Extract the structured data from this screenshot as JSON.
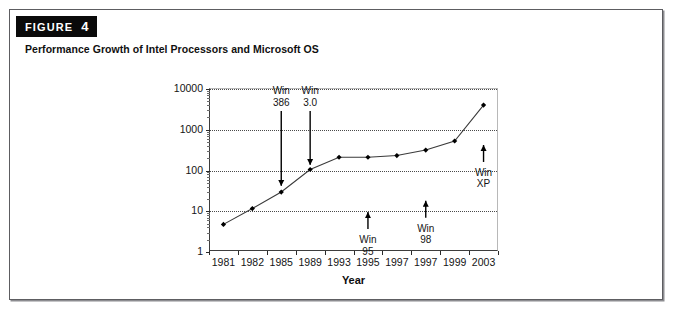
{
  "figure": {
    "badge_word": "FIGURE",
    "badge_number": "4",
    "caption": "Performance Growth of Intel Processors and Microsoft OS"
  },
  "chart_data": {
    "type": "line",
    "title": "Performance Growth of Intel Processors and Microsoft OS",
    "xlabel": "Year",
    "ylabel": "",
    "yscale": "log",
    "ylim": [
      1,
      10000
    ],
    "grid": true,
    "legend": "none",
    "categories": [
      "1981",
      "1982",
      "1985",
      "1989",
      "1993",
      "1995",
      "1997",
      "1997",
      "1999",
      "2003"
    ],
    "y_ticks": [
      "1",
      "10",
      "100",
      "1000",
      "10000"
    ],
    "series": [
      {
        "name": "Intel processor performance",
        "values": [
          4.5,
          11,
          28,
          100,
          200,
          200,
          220,
          300,
          500,
          3800
        ]
      }
    ],
    "annotations": [
      {
        "label_line1": "Win",
        "label_line2": "386",
        "year": "1985",
        "direction": "down",
        "value": 40
      },
      {
        "label_line1": "Win",
        "label_line2": "3.0",
        "year": "1989",
        "direction": "down",
        "value": 130
      },
      {
        "label_line1": "Win",
        "label_line2": "95",
        "year": "1995",
        "direction": "up",
        "value": 9
      },
      {
        "label_line1": "Win",
        "label_line2": "98",
        "year": "1997",
        "direction": "up",
        "value": 17
      },
      {
        "label_line1": "Win",
        "label_line2": "XP",
        "year": "2003",
        "direction": "up",
        "value": 400
      }
    ],
    "colors": {
      "line": "#3a3a3a",
      "marker": "#000000",
      "grid": "#4a4a4a",
      "axis": "#2a2a2a",
      "badge_bg": "#0a0a0a",
      "badge_fg": "#ffffff"
    }
  }
}
